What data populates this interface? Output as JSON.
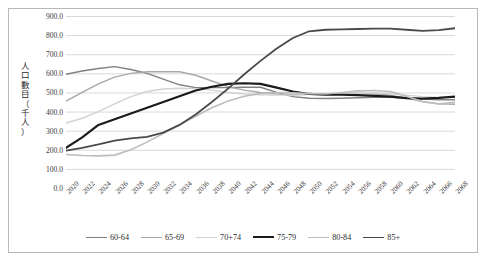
{
  "axis": {
    "y_label_chars": [
      "人",
      "口",
      "數",
      "目",
      "（",
      "千",
      "人",
      "）"
    ],
    "y_ticks": [
      "900.0",
      "800.0",
      "700.0",
      "600.0",
      "500.0",
      "400.0",
      "300.0",
      "200.0",
      "100.0",
      "0.0"
    ]
  },
  "legend": {
    "items": [
      {
        "label": "60-64",
        "color": "#808080",
        "width": 1.4
      },
      {
        "label": "65-69",
        "color": "#a8a8a8",
        "width": 1.4
      },
      {
        "label": "70+74",
        "color": "#d2d2d2",
        "width": 1.4
      },
      {
        "label": "75-79",
        "color": "#1a1a1a",
        "width": 2.2
      },
      {
        "label": "80-84",
        "color": "#bdbdbd",
        "width": 1.6
      },
      {
        "label": "85+",
        "color": "#4a4a4a",
        "width": 1.8
      }
    ]
  },
  "chart_data": {
    "type": "line",
    "title": "",
    "xlabel": "",
    "ylabel": "人口數目（千人）",
    "ylim": [
      0,
      900
    ],
    "yticks": [
      0,
      100,
      200,
      300,
      400,
      500,
      600,
      700,
      800,
      900
    ],
    "grid": true,
    "legend_position": "bottom",
    "x": [
      2020,
      2022,
      2024,
      2026,
      2028,
      2030,
      2032,
      2034,
      2036,
      2038,
      2040,
      2042,
      2044,
      2046,
      2048,
      2050,
      2052,
      2054,
      2056,
      2058,
      2060,
      2062,
      2064,
      2066,
      2068
    ],
    "series": [
      {
        "name": "60-64",
        "color": "#808080",
        "width": 1.4,
        "values": [
          595,
          612,
          625,
          635,
          620,
          600,
          570,
          540,
          525,
          525,
          525,
          527,
          527,
          500,
          478,
          470,
          468,
          470,
          472,
          474,
          476,
          470,
          465,
          462,
          462
        ]
      },
      {
        "name": "65-69",
        "color": "#a8a8a8",
        "width": 1.4,
        "values": [
          455,
          500,
          545,
          580,
          600,
          608,
          608,
          608,
          590,
          560,
          530,
          512,
          500,
          492,
          488,
          490,
          492,
          494,
          496,
          492,
          486,
          470,
          452,
          440,
          438
        ]
      },
      {
        "name": "70+74",
        "color": "#d2d2d2",
        "width": 1.4,
        "values": [
          340,
          365,
          400,
          440,
          478,
          505,
          518,
          522,
          520,
          512,
          500,
          492,
          488,
          486,
          486,
          490,
          492,
          494,
          496,
          498,
          494,
          486,
          478,
          474,
          474
        ]
      },
      {
        "name": "75-79",
        "color": "#1a1a1a",
        "width": 2.2,
        "values": [
          210,
          265,
          330,
          360,
          390,
          420,
          450,
          480,
          510,
          530,
          545,
          548,
          545,
          525,
          505,
          492,
          488,
          488,
          486,
          482,
          478,
          470,
          468,
          472,
          478
        ]
      },
      {
        "name": "80-84",
        "color": "#bdbdbd",
        "width": 1.6,
        "values": [
          175,
          170,
          168,
          172,
          200,
          240,
          285,
          330,
          375,
          420,
          455,
          480,
          495,
          500,
          498,
          494,
          492,
          500,
          508,
          510,
          505,
          480,
          452,
          440,
          448
        ]
      },
      {
        "name": "85+",
        "color": "#4a4a4a",
        "width": 1.8,
        "values": [
          195,
          210,
          228,
          248,
          260,
          268,
          290,
          330,
          385,
          450,
          520,
          595,
          665,
          730,
          785,
          820,
          828,
          830,
          832,
          834,
          834,
          828,
          822,
          826,
          836
        ]
      }
    ]
  }
}
